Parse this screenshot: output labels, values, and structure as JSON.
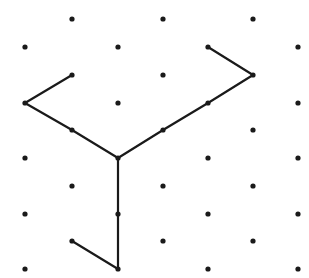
{
  "diagram": {
    "type": "isometric-dot-grid-drawing",
    "width": 309,
    "height": 278,
    "colors": {
      "background": "#ffffff",
      "dot": "#1a1a1a",
      "line": "#1a1a1a"
    },
    "dot_radius": 2.6,
    "line_width": 2.2,
    "dots": [
      [
        25,
        47
      ],
      [
        25,
        103
      ],
      [
        25,
        158
      ],
      [
        25,
        214
      ],
      [
        25,
        269
      ],
      [
        72,
        19
      ],
      [
        72,
        75
      ],
      [
        72,
        130
      ],
      [
        72,
        186
      ],
      [
        72,
        241
      ],
      [
        118,
        47
      ],
      [
        118,
        103
      ],
      [
        118,
        158
      ],
      [
        118,
        214
      ],
      [
        118,
        269
      ],
      [
        163,
        19
      ],
      [
        163,
        75
      ],
      [
        163,
        130
      ],
      [
        163,
        186
      ],
      [
        163,
        241
      ],
      [
        208,
        47
      ],
      [
        208,
        103
      ],
      [
        208,
        158
      ],
      [
        208,
        214
      ],
      [
        208,
        269
      ],
      [
        253,
        19
      ],
      [
        253,
        75
      ],
      [
        253,
        130
      ],
      [
        253,
        186
      ],
      [
        253,
        241
      ],
      [
        298,
        47
      ],
      [
        298,
        103
      ],
      [
        298,
        158
      ],
      [
        298,
        214
      ],
      [
        298,
        269
      ]
    ],
    "paths": [
      {
        "name": "left-arm",
        "points": [
          [
            72,
            75
          ],
          [
            25,
            103
          ],
          [
            72,
            130
          ],
          [
            118,
            158
          ]
        ]
      },
      {
        "name": "right-arm",
        "points": [
          [
            118,
            158
          ],
          [
            163,
            130
          ],
          [
            208,
            103
          ],
          [
            253,
            75
          ],
          [
            208,
            47
          ]
        ]
      },
      {
        "name": "bottom-leg",
        "points": [
          [
            118,
            158
          ],
          [
            118,
            214
          ],
          [
            118,
            269
          ],
          [
            72,
            241
          ]
        ]
      }
    ]
  }
}
